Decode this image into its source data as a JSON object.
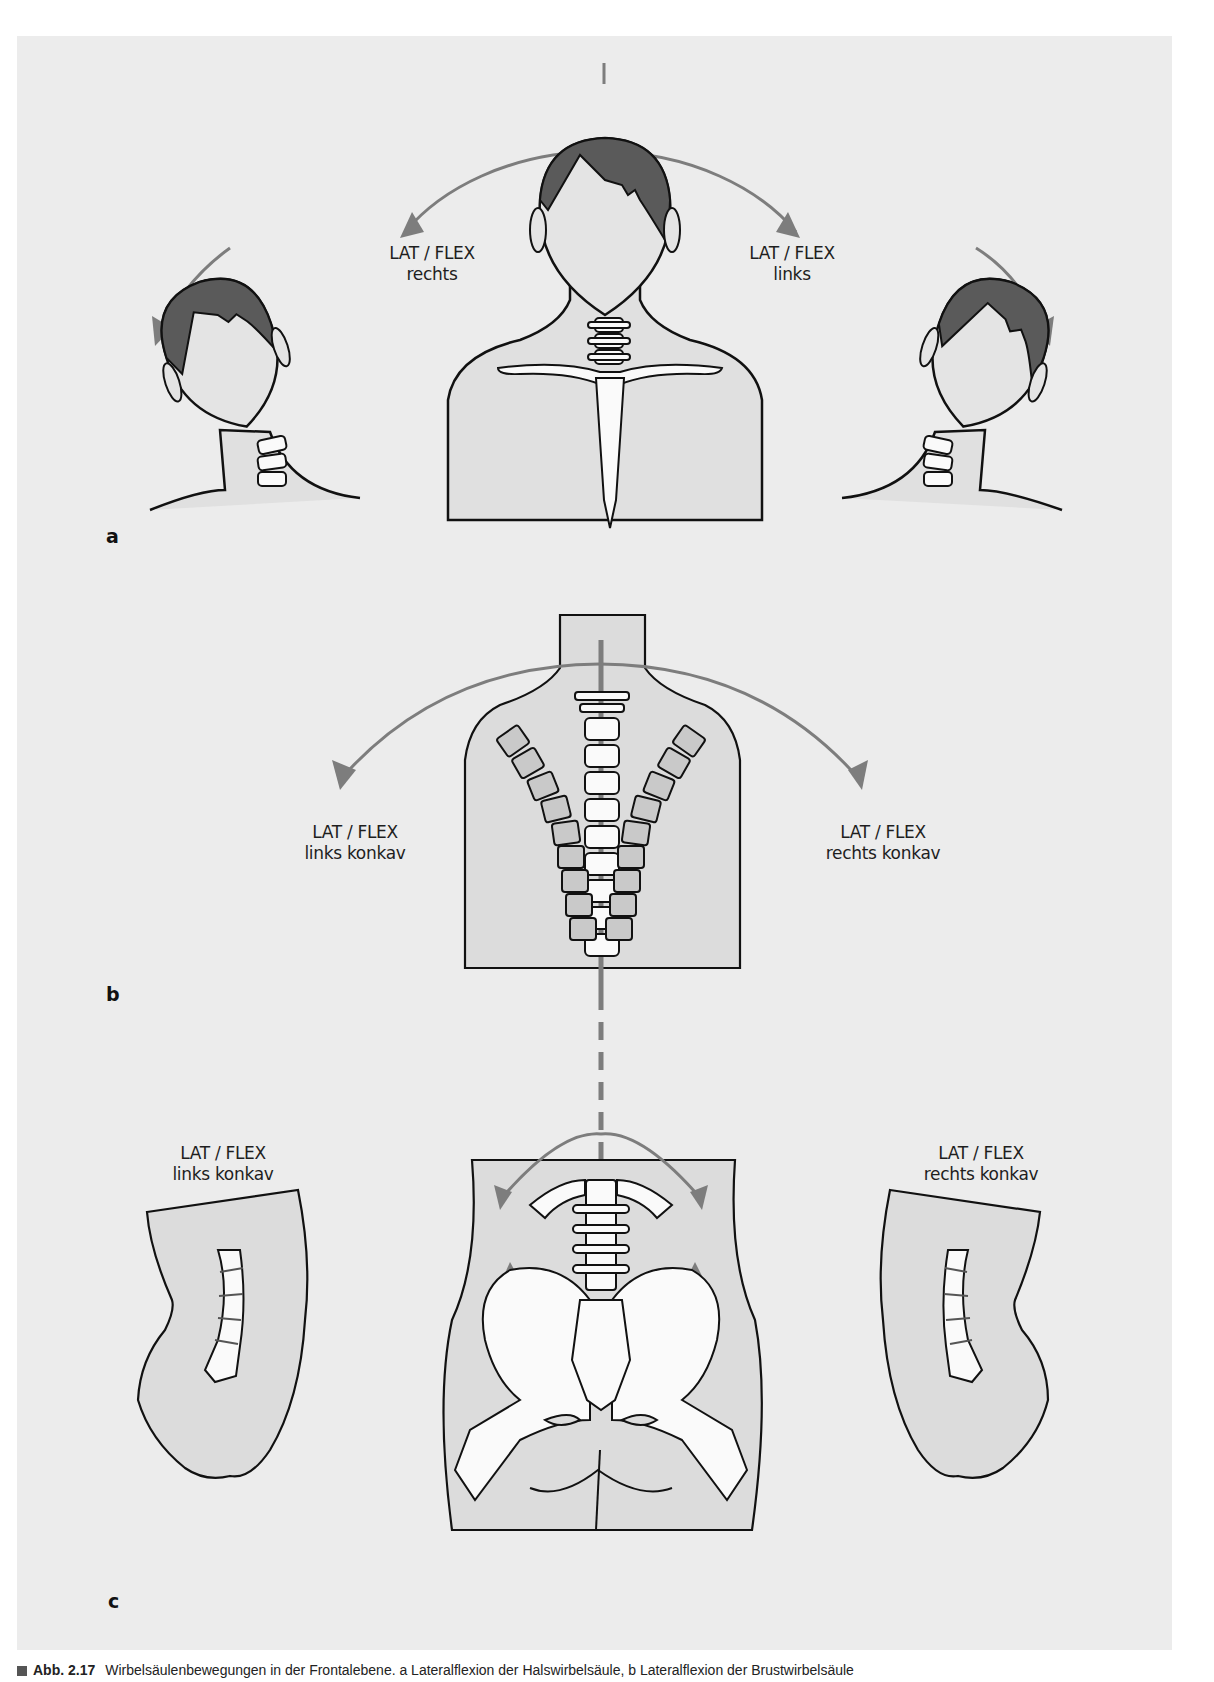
{
  "figure": {
    "background_color": "#ececec",
    "arrow_color": "#7d7d7d",
    "hair_color": "#5a5a5a",
    "skin_fill": "#e0e0e0",
    "bone_fill": "#fafafa",
    "panels": {
      "a": {
        "letter": "a",
        "labels": [
          {
            "line1": "LAT / FLEX",
            "line2": "rechts"
          },
          {
            "line1": "LAT / FLEX",
            "line2": "links"
          }
        ]
      },
      "b": {
        "letter": "b",
        "labels": [
          {
            "line1": "LAT / FLEX",
            "line2": "links konkav"
          },
          {
            "line1": "LAT / FLEX",
            "line2": "rechts konkav"
          }
        ]
      },
      "c": {
        "letter": "c",
        "labels": [
          {
            "line1": "LAT / FLEX",
            "line2": "links konkav"
          },
          {
            "line1": "LAT / FLEX",
            "line2": "rechts konkav"
          }
        ]
      }
    }
  },
  "caption": {
    "figure_number": "Abb. 2.17",
    "text": "Wirbelsäulenbewegungen in der Frontalebene. a Lateralflexion der Halswirbelsäule, b Lateralflexion der Brustwirbelsäule"
  }
}
